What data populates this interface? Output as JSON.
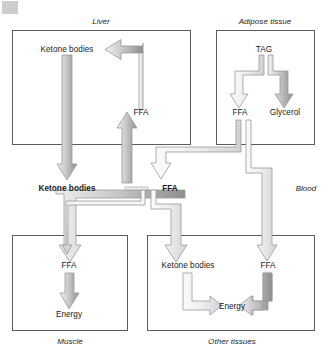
{
  "figure": {
    "colors": {
      "box_border": "#5b5b5b",
      "arrow_fill_light": "#e2e2e2",
      "arrow_fill_mid": "#a9a9a9",
      "arrow_stroke": "#8f8f8f",
      "text": "#1a1a1a",
      "background": "#ffffff"
    }
  },
  "compartments": {
    "liver": {
      "label": "Liver",
      "nodes": {
        "ketone_bodies": "Ketone bodies",
        "ffa": "FFA"
      }
    },
    "adipose": {
      "label": "Adipose tissue",
      "nodes": {
        "tag": "TAG",
        "ffa": "FFA",
        "glycerol": "Glycerol"
      }
    },
    "blood": {
      "label": "Blood",
      "nodes": {
        "ketone_bodies": "Ketone bodies",
        "ffa": "FFA"
      }
    },
    "muscle": {
      "label": "Muscle",
      "nodes": {
        "ffa": "FFA",
        "energy": "Energy"
      }
    },
    "other_tissues": {
      "label": "Other tissues",
      "nodes": {
        "ketone_bodies": "Ketone bodies",
        "ffa": "FFA",
        "energy": "Energy"
      }
    }
  },
  "flows": [
    {
      "id": "liver-ffa-to-liver-ketone",
      "from": "liver.ffa",
      "to": "liver.ketone_bodies"
    },
    {
      "id": "liver-ketone-to-blood-ketone",
      "from": "liver.ketone_bodies",
      "to": "blood.ketone_bodies"
    },
    {
      "id": "blood-ffa-to-liver-ffa",
      "from": "blood.ffa",
      "to": "liver.ffa"
    },
    {
      "id": "adipose-tag-to-adipose-ffa",
      "from": "adipose.tag",
      "to": "adipose.ffa"
    },
    {
      "id": "adipose-tag-to-adipose-glycerol",
      "from": "adipose.tag",
      "to": "adipose.glycerol"
    },
    {
      "id": "adipose-ffa-to-blood-ffa",
      "from": "adipose.ffa",
      "to": "blood.ffa"
    },
    {
      "id": "adipose-ffa-to-other-ffa",
      "from": "adipose.ffa",
      "to": "other_tissues.ffa"
    },
    {
      "id": "blood-ketone-to-muscle-ffa",
      "from": "blood.ketone_bodies",
      "to": "muscle.ffa"
    },
    {
      "id": "blood-ffa-to-muscle-ffa",
      "from": "blood.ffa",
      "to": "muscle.ffa"
    },
    {
      "id": "blood-ffa-to-other-ketone",
      "from": "blood.ffa",
      "to": "other_tissues.ketone_bodies"
    },
    {
      "id": "muscle-ffa-to-muscle-energy",
      "from": "muscle.ffa",
      "to": "muscle.energy"
    },
    {
      "id": "other-ketone-to-other-energy",
      "from": "other_tissues.ketone_bodies",
      "to": "other_tissues.energy"
    },
    {
      "id": "other-ffa-to-other-energy",
      "from": "other_tissues.ffa",
      "to": "other_tissues.energy"
    }
  ]
}
